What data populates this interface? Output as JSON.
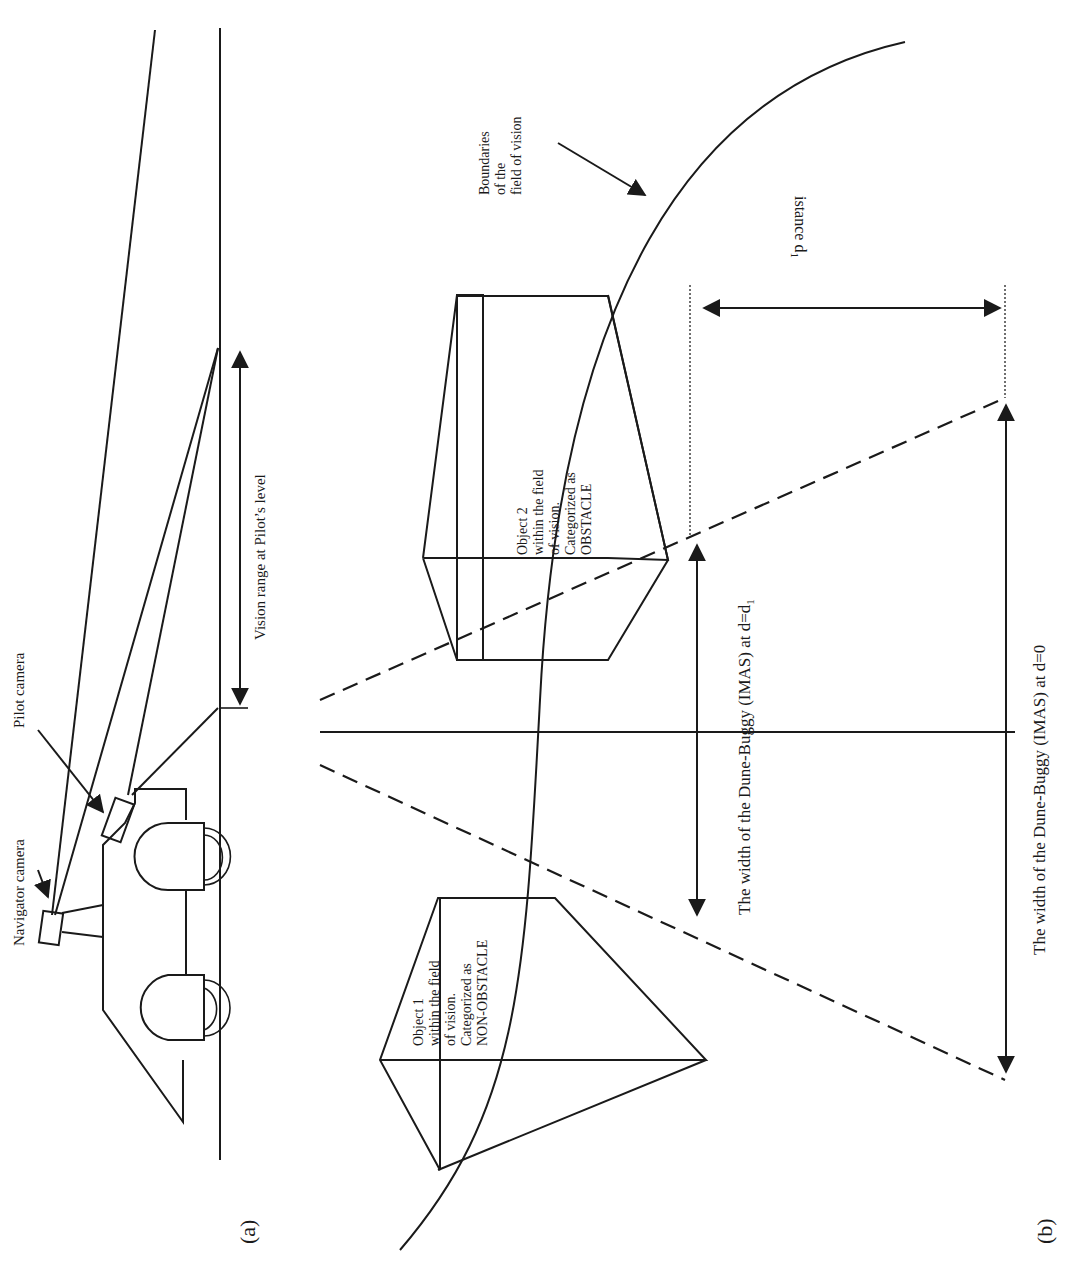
{
  "figure": {
    "orientation": "rotated 90 degrees (text reads bottom-to-top)",
    "panel_a": {
      "label": "(a)",
      "navigator_camera_label": "Navigator camera",
      "pilot_camera_label": "Pilot camera",
      "vision_range_label": "Vision range at Pilot’s level"
    },
    "panel_b": {
      "label": "(b)",
      "boundaries_label": [
        "Boundaries",
        "of the",
        "field of vision"
      ],
      "object1_label": [
        "Object 1",
        "within the field",
        "of vision.",
        "Categorized as",
        "NON-OBSTACLE"
      ],
      "object2_label": [
        "Object 2",
        "within the field",
        "of vision.",
        "Categorized as",
        "OBSTACLE"
      ],
      "distance_label": "istance d",
      "distance_subscript": "1",
      "width_d1_label": "The width of the Dune-Buggy (IMAS) at d=d",
      "width_d1_subscript": "1",
      "width_d0_label": "The width of the Dune-Buggy (IMAS) at d=0"
    }
  },
  "colors": {
    "ink": "#1a1a1a",
    "background": "#ffffff"
  }
}
